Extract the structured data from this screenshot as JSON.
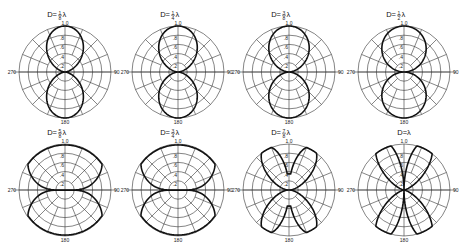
{
  "figure": {
    "angle_labels": {
      "top": "1.0",
      "right": "90",
      "bottom": "180",
      "left": "270"
    },
    "radial_labels": [
      ".8",
      ".6",
      ".4",
      ".2"
    ],
    "plots": [
      {
        "title": "D=⅛λ",
        "num": "1",
        "den": "8",
        "cx": 65,
        "cy": 72,
        "lobes": "fig8",
        "width": 0.55
      },
      {
        "title": "D=¼λ",
        "num": "1",
        "den": "4",
        "cx": 178,
        "cy": 72,
        "lobes": "fig8",
        "width": 0.62
      },
      {
        "title": "D=⅜λ",
        "num": "3",
        "den": "8",
        "cx": 289,
        "cy": 72,
        "lobes": "fig8",
        "width": 0.7
      },
      {
        "title": "D=½λ",
        "num": "1",
        "den": "2",
        "cx": 404,
        "cy": 72,
        "lobes": "fig8",
        "width": 0.9
      },
      {
        "title": "D=⅝λ",
        "num": "5",
        "den": "8",
        "cx": 65,
        "cy": 190,
        "lobes": "wide",
        "width": 1.15
      },
      {
        "title": "D=¾λ",
        "num": "3",
        "den": "4",
        "cx": 178,
        "cy": 190,
        "lobes": "wide",
        "width": 1.35
      },
      {
        "title": "D=⅞λ",
        "num": "7",
        "den": "8",
        "cx": 289,
        "cy": 190,
        "lobes": "butterfly",
        "width": 1.6
      },
      {
        "title": "D=λ",
        "num": "",
        "den": "",
        "cx": 404,
        "cy": 190,
        "lobes": "clover",
        "width": 2.0
      }
    ],
    "radius": 46
  }
}
